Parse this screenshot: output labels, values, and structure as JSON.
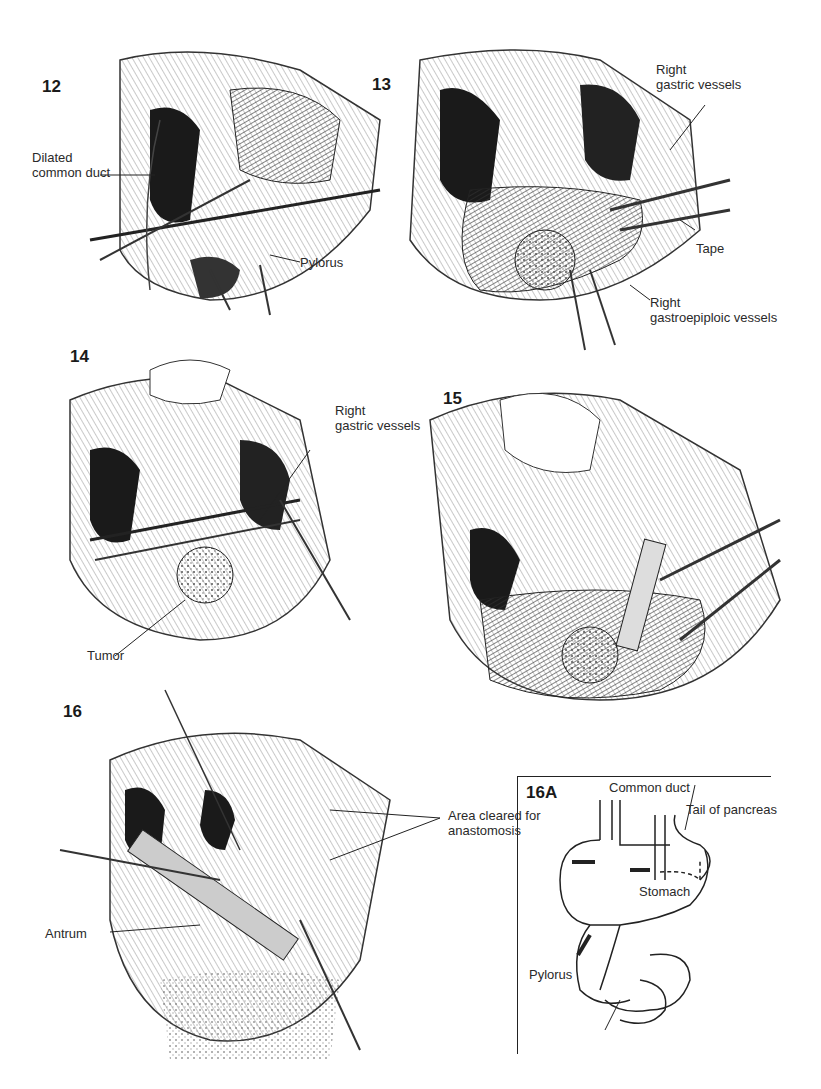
{
  "page": {
    "background": "#ffffff",
    "ink_color": "#1a1a1a"
  },
  "figures": [
    {
      "id": "12",
      "label": "12",
      "callouts": [
        "Dilated\ncommon duct",
        "Pylorus"
      ]
    },
    {
      "id": "13",
      "label": "13",
      "callouts": [
        "Right\ngastric vessels",
        "Tape",
        "Right\ngastroepiploic vessels"
      ]
    },
    {
      "id": "14",
      "label": "14",
      "callouts": [
        "Right\ngastric vessels",
        "Tumor"
      ]
    },
    {
      "id": "15",
      "label": "15",
      "callouts": []
    },
    {
      "id": "16",
      "label": "16",
      "callouts": [
        "Area cleared for\nanastomosis",
        "Antrum"
      ]
    },
    {
      "id": "16A",
      "label": "16A",
      "callouts": [
        "Common duct",
        "Tail of pancreas",
        "Stomach",
        "Pylorus"
      ]
    }
  ]
}
